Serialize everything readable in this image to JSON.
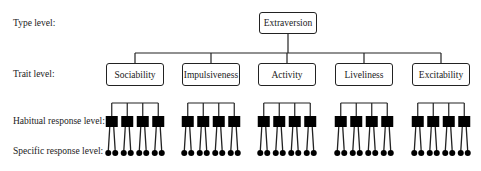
{
  "levels": {
    "type": "Type level:",
    "trait": "Trait level:",
    "habitual": "Habitual response level:",
    "specific": "Specific response level:"
  },
  "type_node": "Extraversion",
  "traits": [
    "Sociability",
    "Impulsiveness",
    "Activity",
    "Liveliness",
    "Excitability"
  ],
  "structure": {
    "habitual_per_trait": 4,
    "specific_per_habitual": 2
  },
  "colors": {
    "line": "#222222",
    "fill": "#000000",
    "background": "#ffffff"
  }
}
